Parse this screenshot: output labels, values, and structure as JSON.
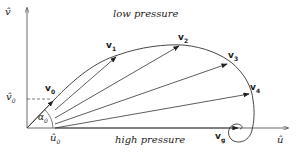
{
  "labels": {
    "low_pressure": "low pressure",
    "high_pressure": "high pressure",
    "y_axis": "v̂",
    "x_axis": "û",
    "v0_hat": "v̂",
    "v0_hat_sub": "0",
    "u0_hat": "û",
    "u0_hat_sub": "0",
    "alpha": "α",
    "alpha_sub": "0",
    "vectors": [
      {
        "name": "v",
        "sub": "0"
      },
      {
        "name": "v",
        "sub": "1"
      },
      {
        "name": "v",
        "sub": "2"
      },
      {
        "name": "v",
        "sub": "3"
      },
      {
        "name": "v",
        "sub": "4"
      },
      {
        "name": "v",
        "sub": "g"
      }
    ]
  },
  "colors": {
    "line": "#333333",
    "text": "#222222"
  }
}
